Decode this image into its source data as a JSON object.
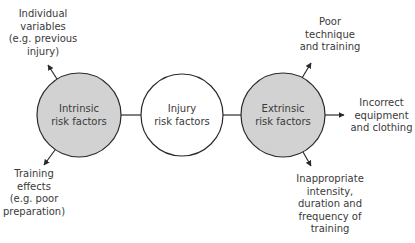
{
  "colors": {
    "shaded_fill": "#d2d2d2",
    "plain_fill": "#ffffff",
    "stroke": "#2a2a2a",
    "text": "#3a3a3a"
  },
  "nodes": {
    "intrinsic": {
      "line1": "Intrinsic",
      "line2": "risk factors"
    },
    "injury": {
      "line1": "Injury",
      "line2": "risk factors"
    },
    "extrinsic": {
      "line1": "Extrinsic",
      "line2": "risk factors"
    }
  },
  "intrinsic_outputs": [
    {
      "lines": [
        "Individual",
        "variables",
        "(e.g. previous",
        "injury)"
      ]
    },
    {
      "lines": [
        "Training",
        "effects",
        "(e.g. poor",
        "preparation)"
      ]
    }
  ],
  "extrinsic_outputs": [
    {
      "lines": [
        "Poor",
        "technique",
        "and training"
      ]
    },
    {
      "lines": [
        "Incorrect",
        "equipment",
        "and clothing"
      ]
    },
    {
      "lines": [
        "Inappropriate",
        "intensity,",
        "duration and",
        "frequency of",
        "training"
      ]
    }
  ]
}
